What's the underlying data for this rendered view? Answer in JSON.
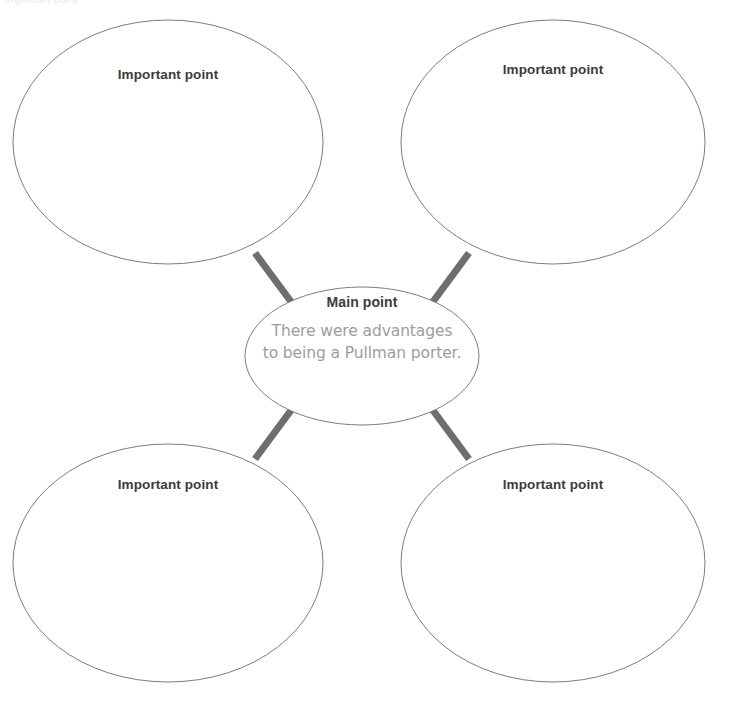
{
  "page": {
    "background_color": "#ffffff",
    "width": 732,
    "height": 708
  },
  "style": {
    "ellipse_stroke_color": "#7d7d7d",
    "ellipse_stroke_width": 1,
    "ellipse_fill": "#ffffff",
    "connector_color": "#6e6e6e",
    "connector_width": 7,
    "heading_text_color": "#3b3b3b",
    "body_text_color": "#9d9d9d"
  },
  "center": {
    "name": "main-point",
    "title": "Main point",
    "body": "There were advantages to being a Pullman porter.",
    "body_line_1": "There were advantages",
    "body_line_2": "to being a Pullman porter.",
    "cx": 362,
    "cy": 356,
    "rx": 117,
    "ry": 69
  },
  "branches": [
    {
      "name": "important-point-top-left",
      "label": "Important point",
      "position": "top-left",
      "cx": 168,
      "cy": 142,
      "rx": 155,
      "ry": 122,
      "label_x": 168,
      "label_y": 67
    },
    {
      "name": "important-point-top-right",
      "label": "Important point",
      "position": "top-right",
      "cx": 553,
      "cy": 142,
      "rx": 152,
      "ry": 122,
      "label_x": 553,
      "label_y": 62
    },
    {
      "name": "important-point-bottom-left",
      "label": "Important point",
      "position": "bottom-left",
      "cx": 168,
      "cy": 563,
      "rx": 155,
      "ry": 119,
      "label_x": 168,
      "label_y": 477
    },
    {
      "name": "important-point-bottom-right",
      "label": "Important point",
      "position": "bottom-right",
      "cx": 553,
      "cy": 563,
      "rx": 152,
      "ry": 119,
      "label_x": 553,
      "label_y": 477
    }
  ],
  "connectors": [
    {
      "name": "connector-center-to-top-left",
      "x1": 292,
      "y1": 303,
      "x2": 255,
      "y2": 253
    },
    {
      "name": "connector-center-to-top-right",
      "x1": 432,
      "y1": 303,
      "x2": 469,
      "y2": 253
    },
    {
      "name": "connector-center-to-bottom-left",
      "x1": 292,
      "y1": 409,
      "x2": 255,
      "y2": 459
    },
    {
      "name": "connector-center-to-bottom-right",
      "x1": 432,
      "y1": 409,
      "x2": 469,
      "y2": 459
    }
  ],
  "artifacts": {
    "cropped_header_text": "Important point"
  }
}
